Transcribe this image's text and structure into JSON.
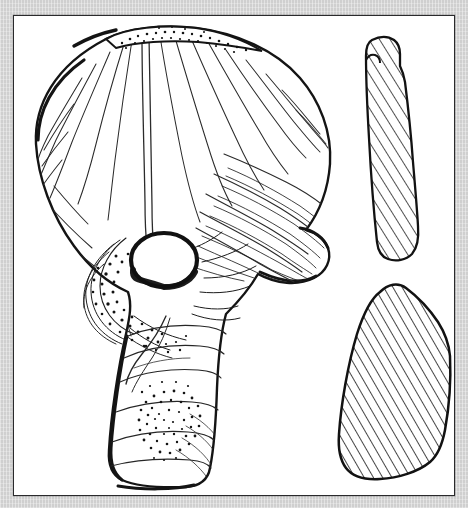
{
  "plate": {
    "background_color": "#d5d5d5",
    "plate_color": "#ffffff",
    "border_color": "#2a2a2c",
    "ink_color": "#1a1a1a",
    "caption": "",
    "figure_number": "",
    "scale_label": ""
  },
  "illustration": {
    "subject": "perforated stone axe-hammer",
    "technique": "pen-and-ink archaeological line drawing",
    "views": [
      {
        "id": "main-view",
        "name": "face-view",
        "label": "",
        "description": "Fan-shaped blade with central shaft-hole and rectangular butt",
        "features": [
          "flared fan-shaped blade with radiating flake scars",
          "stippled cutting edge along the upper margin",
          "circular shaft perforation at centre",
          "pecked and battered ring of damage around the perforation",
          "tapering rectangular butt with stippled circular impact patch"
        ]
      },
      {
        "id": "section-upper",
        "name": "cross-section-blade",
        "label": "",
        "description": "Narrow elongated hatched section through the blade",
        "hatch_angle_deg": 32,
        "hatch_spacing_px": 9
      },
      {
        "id": "section-lower",
        "name": "cross-section-butt",
        "label": "",
        "description": "Broad wedge-shaped hatched section through the butt",
        "hatch_angle_deg": 30,
        "hatch_spacing_px": 8
      }
    ]
  }
}
